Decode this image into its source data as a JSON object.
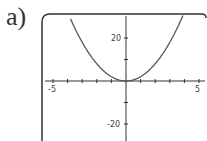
{
  "panel_label": "a)",
  "chart_data": {
    "type": "line",
    "title": "",
    "function": "y = 2x^2",
    "xlabel": "",
    "ylabel": "",
    "xlim": [
      -5,
      5
    ],
    "ylim": [
      -25,
      31
    ],
    "x_ticks": [
      -5,
      5
    ],
    "y_ticks": [
      -20,
      20
    ],
    "x_minor_tick_step": 1,
    "y_minor_tick_step": 10,
    "grid": false,
    "series": [
      {
        "name": "parabola",
        "x": [
          -3.8,
          -3,
          -2,
          -1,
          0,
          1,
          2,
          3,
          3.9
        ],
        "values": [
          28.9,
          18,
          8,
          2,
          0,
          2,
          8,
          18,
          30.4
        ]
      }
    ],
    "colors": {
      "curve": "#555555",
      "axes": "#333333",
      "frame": "#333333"
    }
  },
  "tick_labels": {
    "x_neg": "-5",
    "x_pos": "5",
    "y_pos": "20",
    "y_neg": "-20"
  }
}
